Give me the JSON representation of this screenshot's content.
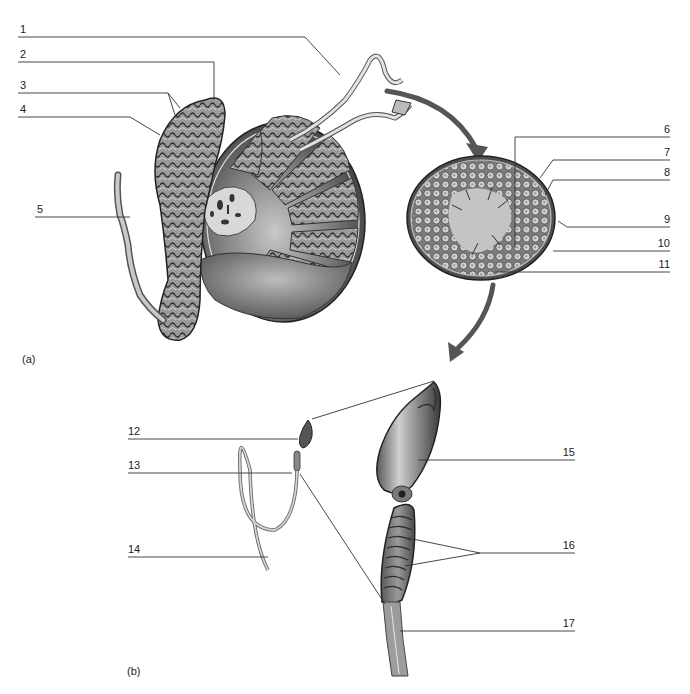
{
  "figure": {
    "panels": [
      {
        "id": "a",
        "label": "(a)"
      },
      {
        "id": "b",
        "label": "(b)"
      }
    ],
    "callouts": [
      {
        "num": "1"
      },
      {
        "num": "2"
      },
      {
        "num": "3"
      },
      {
        "num": "4"
      },
      {
        "num": "5"
      },
      {
        "num": "6"
      },
      {
        "num": "7"
      },
      {
        "num": "8"
      },
      {
        "num": "9"
      },
      {
        "num": "10"
      },
      {
        "num": "11"
      },
      {
        "num": "12"
      },
      {
        "num": "13"
      },
      {
        "num": "14"
      },
      {
        "num": "15"
      },
      {
        "num": "16"
      },
      {
        "num": "17"
      }
    ],
    "colors": {
      "line": "#333333",
      "tissue_dark": "#4a4a4a",
      "tissue_mid": "#8a8a8a",
      "tissue_light": "#d0d0d0",
      "arrow": "#555555"
    }
  }
}
